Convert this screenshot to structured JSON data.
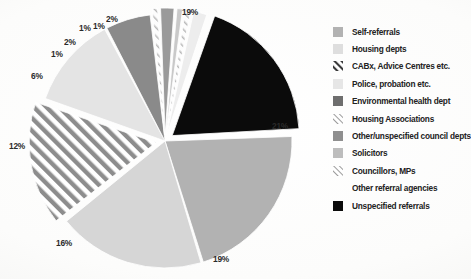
{
  "chart_data": {
    "type": "pie",
    "title": "",
    "xlabel": "",
    "ylabel": "",
    "legend_position": "right",
    "grid": false,
    "value_unit": "%",
    "categories": [
      "Self-referrals",
      "Housing depts",
      "CABx, Advice Centres etc.",
      "Police, probation etc.",
      "Environmental health dept",
      "Housing Associations",
      "Other/unspecified council depts",
      "Solicitors",
      "Councillors, MPs",
      "Other referral agencies",
      "Unspecified referrals"
    ],
    "values": [
      21,
      19,
      16,
      12,
      6,
      1,
      2,
      1,
      1,
      2,
      19
    ],
    "labels": [
      "21%",
      "19%",
      "16%",
      "12%",
      "6%",
      "1%",
      "2%",
      "1%",
      "1%",
      "2%",
      "19%"
    ],
    "slices": [
      {
        "label": "Unspecified referrals",
        "value": 19,
        "display": "19%",
        "fill": "#0b0b0b",
        "pattern": "solid",
        "exploded": true
      },
      {
        "label": "Self-referrals",
        "value": 21,
        "display": "21%",
        "fill": "#b2b2b2",
        "pattern": "solid",
        "exploded": false
      },
      {
        "label": "Housing depts",
        "value": 19,
        "display": "19%",
        "fill": "#d6d6d6",
        "pattern": "solid",
        "exploded": false
      },
      {
        "label": "CABx, Advice Centres etc.",
        "value": 16,
        "display": "16%",
        "fill": "#ffffff",
        "pattern": "diagonal-stripes",
        "exploded": true
      },
      {
        "label": "Police, probation etc.",
        "value": 12,
        "display": "12%",
        "fill": "#e4e4e4",
        "pattern": "solid",
        "exploded": false
      },
      {
        "label": "Environmental health dept",
        "value": 6,
        "display": "6%",
        "fill": "#8a8a8a",
        "pattern": "solid",
        "exploded": false
      },
      {
        "label": "Housing Associations",
        "value": 1,
        "display": "1%",
        "fill": "#fafafa",
        "pattern": "fine-diagonal",
        "exploded": true
      },
      {
        "label": "Other/unspecified council depts",
        "value": 2,
        "display": "2%",
        "fill": "#9a9a9a",
        "pattern": "solid",
        "exploded": true
      },
      {
        "label": "Solicitors",
        "value": 1,
        "display": "1%",
        "fill": "#c9c9c9",
        "pattern": "solid",
        "exploded": true
      },
      {
        "label": "Councillors, MPs",
        "value": 1,
        "display": "1%",
        "fill": "#f2f2f2",
        "pattern": "fine-diagonal",
        "exploded": true
      },
      {
        "label": "Other referral agencies",
        "value": 2,
        "display": "2%",
        "fill": "#ededed",
        "pattern": "solid",
        "exploded": true
      }
    ]
  },
  "value_labels": [
    {
      "text": "19%",
      "x": 182,
      "y": 6
    },
    {
      "text": "21%",
      "x": 272,
      "y": 120
    },
    {
      "text": "19%",
      "x": 213,
      "y": 253
    },
    {
      "text": "16%",
      "x": 56,
      "y": 237
    },
    {
      "text": "12%",
      "x": 9,
      "y": 140
    },
    {
      "text": "6%",
      "x": 31,
      "y": 70
    },
    {
      "text": "1%",
      "x": 51,
      "y": 48
    },
    {
      "text": "2%",
      "x": 64,
      "y": 36
    },
    {
      "text": "1%",
      "x": 79,
      "y": 22
    },
    {
      "text": "1%",
      "x": 93,
      "y": 20
    },
    {
      "text": "2%",
      "x": 106,
      "y": 13
    }
  ],
  "legend": {
    "items": [
      {
        "label": "Self-referrals",
        "fill": "#b2b2b2",
        "pattern": "solid"
      },
      {
        "label": "Housing depts",
        "fill": "#dedede",
        "pattern": "solid"
      },
      {
        "label": "CABx, Advice Centres etc.",
        "fill": "#ffffff",
        "pattern": "diagonal-stripes"
      },
      {
        "label": "Police, probation etc.",
        "fill": "#e6e6e6",
        "pattern": "solid"
      },
      {
        "label": "Environmental health dept",
        "fill": "#6e6e6e",
        "pattern": "solid"
      },
      {
        "label": "Housing Associations",
        "fill": "#fbfbfb",
        "pattern": "fine-diagonal"
      },
      {
        "label": "Other/unspecified council depts",
        "fill": "#8f8f8f",
        "pattern": "solid"
      },
      {
        "label": "Solicitors",
        "fill": "#bdbdbd",
        "pattern": "solid"
      },
      {
        "label": "Councillors, MPs",
        "fill": "#fafafa",
        "pattern": "fine-diagonal"
      },
      {
        "label": "Other referral agencies",
        "fill": "#ffffff",
        "pattern": "none"
      },
      {
        "label": "Unspecified referrals",
        "fill": "#0b0b0b",
        "pattern": "solid"
      }
    ]
  }
}
